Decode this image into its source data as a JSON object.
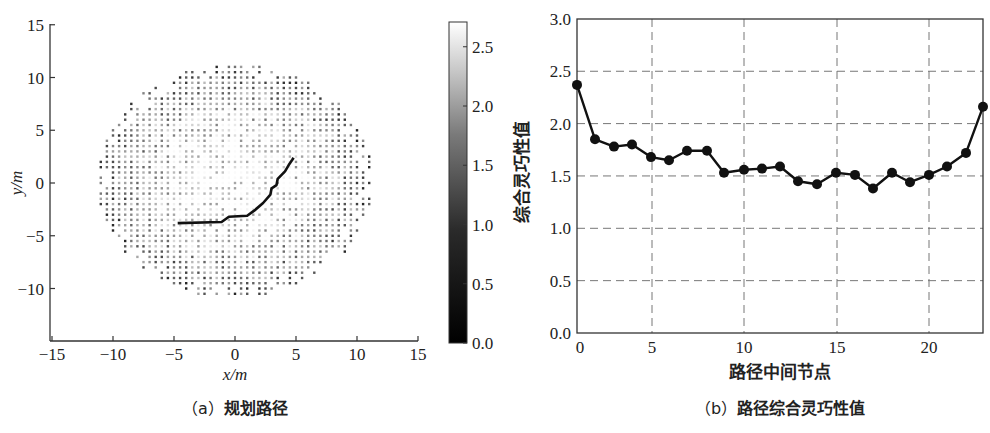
{
  "chart_data": [
    {
      "id": "a",
      "type": "scatter",
      "title": "(a) 规划路径",
      "caption_prefix": "（a）",
      "caption_text": "规划路径",
      "xlabel": "x/m",
      "ylabel": "y/m",
      "xlim": [
        -15,
        15
      ],
      "ylim": [
        -15,
        15
      ],
      "xticks": [
        -15,
        -10,
        -5,
        0,
        5,
        10,
        15
      ],
      "yticks": [
        -10,
        -5,
        0,
        5,
        10,
        15
      ],
      "xtick_labels": [
        "−15",
        "−10",
        "−5",
        "0",
        "5",
        "10",
        "15"
      ],
      "ytick_labels": [
        "−10",
        "−5",
        "0",
        "5",
        "10",
        "15"
      ],
      "grid": false,
      "workspace_points": {
        "description": "grid of points colored by dexterity value (grayscale), roughly elliptical region",
        "x_range": [
          -11.5,
          11.5
        ],
        "y_range": [
          -11,
          11.5
        ],
        "spacing": 0.5
      },
      "path": {
        "x": [
          -4.7,
          -1.1,
          -0.5,
          1.0,
          1.6,
          2.3,
          2.9,
          3.0,
          3.4,
          3.5,
          4.1,
          4.4,
          4.7,
          4.8
        ],
        "y": [
          -3.8,
          -3.7,
          -3.2,
          -3.1,
          -2.6,
          -1.9,
          -1.1,
          -0.5,
          -0.2,
          0.4,
          1.1,
          1.7,
          2.2,
          2.4
        ]
      },
      "colorbar": {
        "min": 0.0,
        "max": 2.7,
        "ticks": [
          0.0,
          0.5,
          1.0,
          1.5,
          2.0,
          2.5
        ],
        "tick_labels": [
          "0.0",
          "0.5",
          "1.0",
          "1.5",
          "2.0",
          "2.5"
        ],
        "colormap": "gray"
      }
    },
    {
      "id": "b",
      "type": "line",
      "title": "(b) 路径综合灵巧性值",
      "caption_prefix": "（b）",
      "caption_text": "路径综合灵巧性值",
      "xlabel": "路径中间节点",
      "ylabel": "综合灵巧性值",
      "xlim": [
        0,
        23
      ],
      "ylim": [
        0.0,
        3.0
      ],
      "xtick_labels": [
        "0",
        "5",
        "10",
        "15",
        "20"
      ],
      "ytick_labels": [
        "0.0",
        "0.5",
        "1.0",
        "1.5",
        "2.0",
        "2.5",
        "3.0"
      ],
      "yticks": [
        0.0,
        0.5,
        1.0,
        1.5,
        2.0,
        2.5,
        3.0
      ],
      "grid": true,
      "marker": "filled-circle",
      "x": [
        0,
        1,
        2,
        3,
        4,
        5,
        6,
        7,
        8,
        9,
        10,
        11,
        12,
        13,
        14,
        15,
        16,
        17,
        18,
        19,
        20,
        21,
        22
      ],
      "values": [
        2.37,
        1.85,
        1.78,
        1.8,
        1.68,
        1.65,
        1.74,
        1.74,
        1.53,
        1.56,
        1.57,
        1.59,
        1.45,
        1.42,
        1.53,
        1.51,
        1.38,
        1.53,
        1.44,
        1.51,
        1.59,
        1.72,
        2.16
      ],
      "point_px_x": [
        577,
        595,
        614,
        632,
        651,
        669,
        687,
        707,
        724,
        744,
        762,
        780,
        798,
        817,
        836,
        855,
        873,
        892,
        910,
        929,
        947,
        966,
        983
      ]
    }
  ]
}
